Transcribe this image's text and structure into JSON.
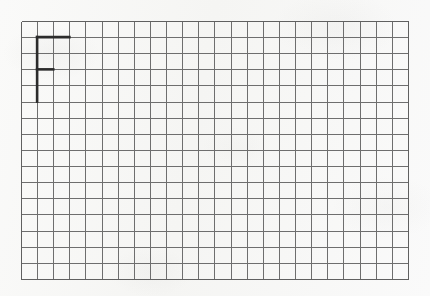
{
  "page": {
    "background_color": "#f8f8f7",
    "width": 430,
    "height": 296
  },
  "grid": {
    "origin_x": 21,
    "origin_y": 21,
    "cell_size": 16.12,
    "columns": 24,
    "rows": 16,
    "line_color": "#6e6e6e",
    "line_width": 1,
    "border_color": "#606060",
    "border_width": 1.2
  },
  "drawing": {
    "name": "letter-f",
    "label": "F",
    "stroke_color": "#2b2b2b",
    "stroke_width": 2.6,
    "description": "Bold letter F drawn on the grid",
    "strokes": [
      {
        "name": "vertical-stem",
        "col_start": 1,
        "row_start": 1,
        "col_end": 1,
        "row_end": 5
      },
      {
        "name": "top-arm",
        "col_start": 1,
        "row_start": 1,
        "col_end": 3,
        "row_end": 1
      },
      {
        "name": "middle-arm",
        "col_start": 1,
        "row_start": 3,
        "col_end": 2,
        "row_end": 3
      }
    ]
  }
}
